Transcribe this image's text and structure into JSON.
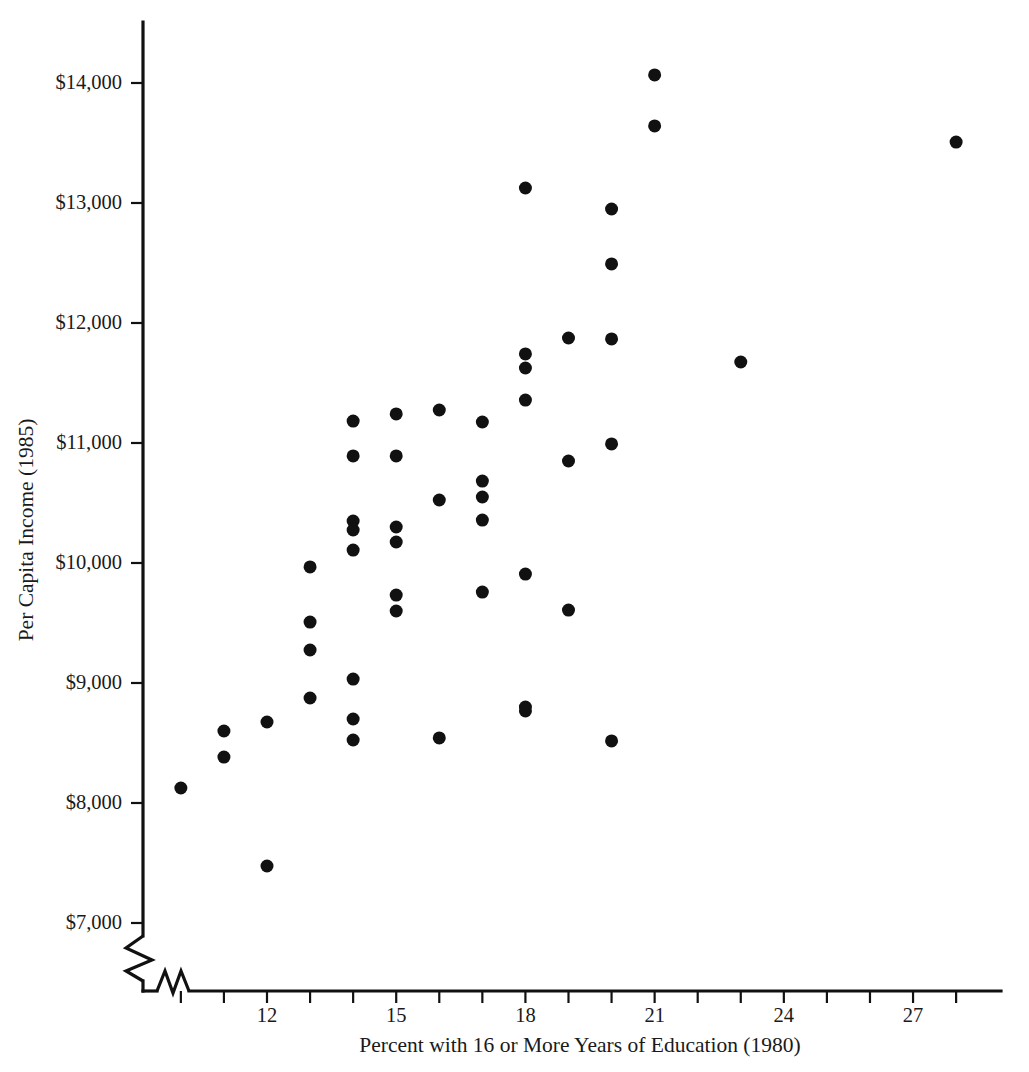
{
  "chart_data": {
    "type": "scatter",
    "title": "",
    "xlabel": "Percent with 16 or More Years of Education (1980)",
    "ylabel": "Per Capita Income (1985)",
    "xlim": [
      9.2,
      28.6
    ],
    "ylim": [
      7000,
      14300
    ],
    "grid": false,
    "legend": null,
    "axis_break_x": true,
    "axis_break_y": true,
    "x_ticks": [
      10,
      11,
      12,
      13,
      14,
      15,
      16,
      17,
      18,
      19,
      20,
      21,
      22,
      23,
      24,
      25,
      26,
      27,
      28
    ],
    "x_tick_labels": [
      "",
      "",
      "12",
      "",
      "",
      "15",
      "",
      "",
      "18",
      "",
      "",
      "21",
      "",
      "",
      "24",
      "",
      "",
      "27",
      ""
    ],
    "y_ticks": [
      7000,
      8000,
      9000,
      10000,
      11000,
      12000,
      13000,
      14000
    ],
    "y_tick_labels": [
      "$7,000",
      "$8,000",
      "$9,000",
      "$10,000",
      "$11,000",
      "$12,000",
      "$13,000",
      "$14,000"
    ],
    "marker": "filled-circle",
    "marker_color": "#111111",
    "marker_size_px": 13,
    "points": [
      {
        "x": 10.0,
        "y": 8125
      },
      {
        "x": 11.0,
        "y": 8600
      },
      {
        "x": 11.0,
        "y": 8383
      },
      {
        "x": 12.0,
        "y": 8675
      },
      {
        "x": 12.0,
        "y": 7475
      },
      {
        "x": 13.0,
        "y": 9967
      },
      {
        "x": 13.0,
        "y": 9508
      },
      {
        "x": 13.0,
        "y": 9275
      },
      {
        "x": 13.0,
        "y": 8875
      },
      {
        "x": 14.0,
        "y": 11183
      },
      {
        "x": 14.0,
        "y": 10892
      },
      {
        "x": 14.0,
        "y": 10350
      },
      {
        "x": 14.0,
        "y": 10275
      },
      {
        "x": 14.0,
        "y": 10108
      },
      {
        "x": 14.0,
        "y": 9033
      },
      {
        "x": 14.0,
        "y": 8700
      },
      {
        "x": 14.0,
        "y": 8525
      },
      {
        "x": 15.0,
        "y": 11242
      },
      {
        "x": 15.0,
        "y": 10892
      },
      {
        "x": 15.0,
        "y": 10300
      },
      {
        "x": 15.0,
        "y": 10175
      },
      {
        "x": 15.0,
        "y": 9733
      },
      {
        "x": 15.0,
        "y": 9600
      },
      {
        "x": 16.0,
        "y": 11275
      },
      {
        "x": 16.0,
        "y": 10525
      },
      {
        "x": 16.0,
        "y": 8542
      },
      {
        "x": 17.0,
        "y": 11175
      },
      {
        "x": 17.0,
        "y": 10683
      },
      {
        "x": 17.0,
        "y": 10550
      },
      {
        "x": 17.0,
        "y": 10358
      },
      {
        "x": 17.0,
        "y": 9758
      },
      {
        "x": 18.0,
        "y": 13125
      },
      {
        "x": 18.0,
        "y": 11742
      },
      {
        "x": 18.0,
        "y": 11625
      },
      {
        "x": 18.0,
        "y": 11358
      },
      {
        "x": 18.0,
        "y": 9908
      },
      {
        "x": 18.0,
        "y": 8800
      },
      {
        "x": 18.0,
        "y": 8767
      },
      {
        "x": 19.0,
        "y": 11875
      },
      {
        "x": 19.0,
        "y": 10850
      },
      {
        "x": 19.0,
        "y": 9608
      },
      {
        "x": 20.0,
        "y": 12950
      },
      {
        "x": 20.0,
        "y": 12492
      },
      {
        "x": 20.0,
        "y": 11867
      },
      {
        "x": 20.0,
        "y": 10992
      },
      {
        "x": 20.0,
        "y": 8517
      },
      {
        "x": 21.0,
        "y": 14067
      },
      {
        "x": 21.0,
        "y": 13642
      },
      {
        "x": 23.0,
        "y": 11675
      },
      {
        "x": 28.0,
        "y": 13508
      }
    ]
  },
  "axes": {
    "y_axis_title": "Per Capita Income (1985)",
    "x_axis_title": "Percent with 16 or More Years of Education (1980)"
  },
  "colors": {
    "background": "#ffffff",
    "axis": "#111111",
    "marker": "#111111",
    "text": "#1a1a1a"
  }
}
